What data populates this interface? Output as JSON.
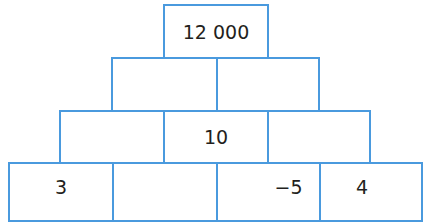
{
  "pyramid": {
    "line_color": "#4a9ade",
    "rows": [
      {
        "bricks": [
          "12 000"
        ]
      },
      {
        "bricks": [
          "",
          ""
        ]
      },
      {
        "bricks": [
          "",
          "10",
          ""
        ]
      },
      {
        "bricks": [
          "3",
          "",
          "−5",
          "4"
        ]
      }
    ]
  }
}
